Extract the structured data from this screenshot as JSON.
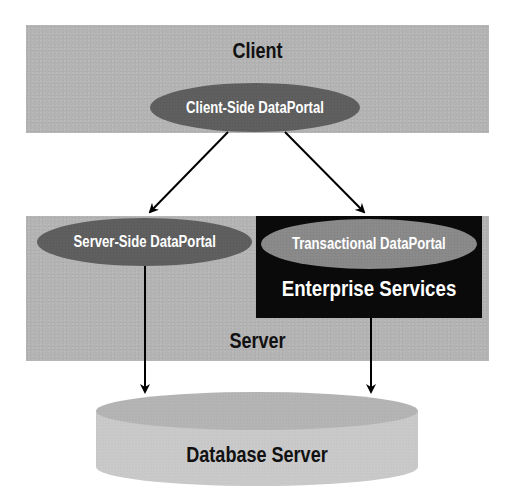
{
  "diagram": {
    "type": "architecture",
    "colors": {
      "tier_fill": "#b3b3b3",
      "ellipse_fill": "#5f5f5f",
      "transactional_ellipse_fill": "#8a8a8a",
      "enterprise_box_fill": "#0a0a0a",
      "database_fill": "#c8c8c8",
      "database_top_fill": "#b8b8b8",
      "arrow_color": "#000000"
    },
    "client": {
      "label": "Client",
      "component": "Client-Side DataPortal"
    },
    "server": {
      "label": "Server",
      "components": [
        {
          "label": "Server-Side DataPortal"
        },
        {
          "label": "Transactional DataPortal",
          "container": "Enterprise Services"
        }
      ],
      "enterprise_label": "Enterprise Services"
    },
    "database": {
      "label": "Database Server"
    },
    "edges": [
      {
        "from": "Client-Side DataPortal",
        "to": "Server-Side DataPortal"
      },
      {
        "from": "Client-Side DataPortal",
        "to": "Transactional DataPortal"
      },
      {
        "from": "Server-Side DataPortal",
        "to": "Database Server"
      },
      {
        "from": "Transactional DataPortal",
        "to": "Database Server"
      }
    ]
  }
}
